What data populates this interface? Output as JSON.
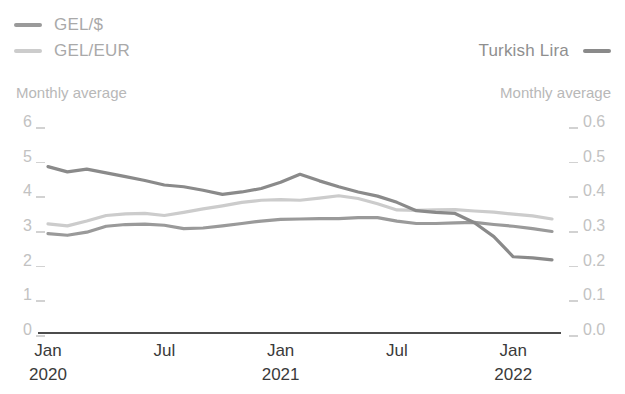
{
  "legend": {
    "left_items": [
      {
        "label": "GEL/$",
        "color": "#9a9a9a",
        "icon": "line-swatch-icon"
      },
      {
        "label": "GEL/EUR",
        "color": "#cccccc",
        "icon": "line-swatch-icon"
      }
    ],
    "right_items": [
      {
        "label": "Turkish Lira",
        "color": "#8a8a8a",
        "icon": "line-swatch-icon"
      }
    ]
  },
  "captions": {
    "left": "Monthly average",
    "right": "Monthly average"
  },
  "chart_data": {
    "type": "line",
    "title": "",
    "xlabel": "",
    "ylabel": "",
    "grid": false,
    "legend_position": "top",
    "x": [
      "Jan 2020",
      "Feb 2020",
      "Mar 2020",
      "Apr 2020",
      "May 2020",
      "Jun 2020",
      "Jul 2020",
      "Aug 2020",
      "Sep 2020",
      "Oct 2020",
      "Nov 2020",
      "Dec 2020",
      "Jan 2021",
      "Feb 2021",
      "Mar 2021",
      "Apr 2021",
      "May 2021",
      "Jun 2021",
      "Jul 2021",
      "Aug 2021",
      "Sep 2021",
      "Oct 2021",
      "Nov 2021",
      "Dec 2021",
      "Jan 2022",
      "Feb 2022",
      "Mar 2022"
    ],
    "x_tick_labels": [
      {
        "month": "Jan",
        "year": "2020",
        "index": 0
      },
      {
        "month": "Jul",
        "year": "",
        "index": 6
      },
      {
        "month": "Jan",
        "year": "2021",
        "index": 12
      },
      {
        "month": "Jul",
        "year": "",
        "index": 18
      },
      {
        "month": "Jan",
        "year": "2022",
        "index": 24
      }
    ],
    "left_axis": {
      "label": "",
      "ylim": [
        0,
        6
      ],
      "ticks": [
        "0",
        "1",
        "2",
        "3",
        "4",
        "5",
        "6"
      ],
      "tick_values": [
        0,
        1,
        2,
        3,
        4,
        5,
        6
      ]
    },
    "right_axis": {
      "label": "",
      "ylim": [
        0.0,
        0.6
      ],
      "ticks": [
        "0.0",
        "0.1",
        "0.2",
        "0.3",
        "0.4",
        "0.5",
        "0.6"
      ],
      "tick_values": [
        0.0,
        0.1,
        0.2,
        0.3,
        0.4,
        0.5,
        0.6
      ]
    },
    "series": [
      {
        "name": "GEL/$",
        "axis": "left",
        "color": "#9a9a9a",
        "values": [
          2.84,
          2.79,
          2.88,
          3.05,
          3.1,
          3.11,
          3.08,
          2.98,
          3.0,
          3.06,
          3.13,
          3.2,
          3.25,
          3.26,
          3.27,
          3.27,
          3.3,
          3.3,
          3.2,
          3.13,
          3.13,
          3.15,
          3.16,
          3.1,
          3.05,
          2.98,
          2.9
        ]
      },
      {
        "name": "GEL/EUR",
        "axis": "left",
        "color": "#cccccc",
        "values": [
          3.12,
          3.06,
          3.2,
          3.36,
          3.41,
          3.42,
          3.36,
          3.45,
          3.55,
          3.64,
          3.74,
          3.8,
          3.82,
          3.8,
          3.86,
          3.93,
          3.85,
          3.7,
          3.52,
          3.51,
          3.52,
          3.53,
          3.49,
          3.46,
          3.4,
          3.35,
          3.26
        ]
      },
      {
        "name": "Turkish Lira",
        "axis": "right",
        "color": "#8a8a8a",
        "values": [
          0.477,
          0.462,
          0.47,
          0.459,
          0.448,
          0.437,
          0.424,
          0.419,
          0.409,
          0.397,
          0.404,
          0.414,
          0.432,
          0.455,
          0.436,
          0.419,
          0.404,
          0.392,
          0.374,
          0.35,
          0.345,
          0.342,
          0.315,
          0.275,
          0.217,
          0.214,
          0.208
        ]
      }
    ]
  }
}
